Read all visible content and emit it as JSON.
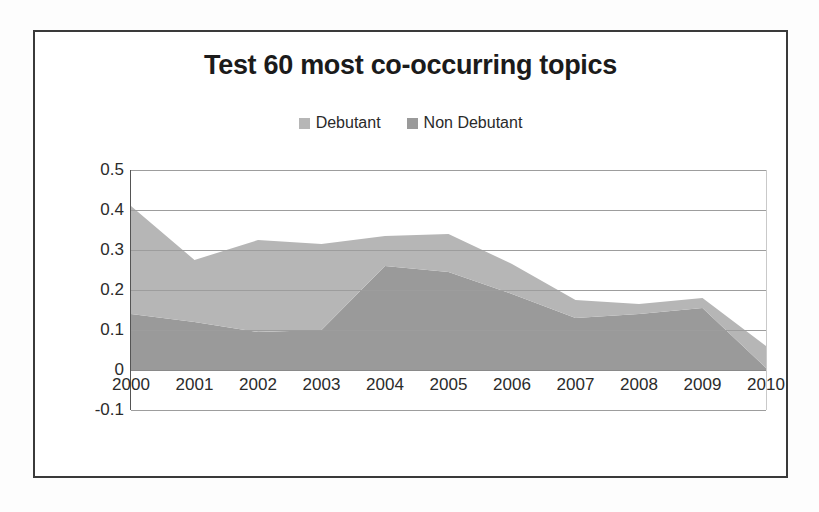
{
  "chart_data": {
    "type": "area",
    "stacked": true,
    "title": "Test 60 most co-occurring topics",
    "xlabel": "",
    "ylabel": "",
    "categories": [
      "2000",
      "2001",
      "2002",
      "2003",
      "2004",
      "2005",
      "2006",
      "2007",
      "2008",
      "2009",
      "2010"
    ],
    "series": [
      {
        "name": "Non Debutant",
        "color": "#9a9a9a",
        "values": [
          0.14,
          0.12,
          0.095,
          0.1,
          0.26,
          0.245,
          0.19,
          0.13,
          0.14,
          0.155,
          0.005
        ]
      },
      {
        "name": "Debutant",
        "color": "#b6b6b6",
        "values": [
          0.27,
          0.155,
          0.23,
          0.215,
          0.075,
          0.095,
          0.075,
          0.045,
          0.025,
          0.025,
          0.055
        ]
      }
    ],
    "stack_totals": [
      0.41,
      0.275,
      0.325,
      0.315,
      0.335,
      0.34,
      0.265,
      0.175,
      0.165,
      0.18,
      0.06
    ],
    "ylim": [
      -0.1,
      0.5
    ],
    "yticks": [
      "0.5",
      "0.4",
      "0.3",
      "0.2",
      "0.1",
      "0",
      "-0.1"
    ],
    "ytick_values": [
      0.5,
      0.4,
      0.3,
      0.2,
      0.1,
      0,
      -0.1
    ],
    "grid": true,
    "legend_position": "top"
  },
  "legend": {
    "items": [
      {
        "label": "Debutant",
        "color": "#b6b6b6"
      },
      {
        "label": "Non Debutant",
        "color": "#9a9a9a"
      }
    ]
  }
}
